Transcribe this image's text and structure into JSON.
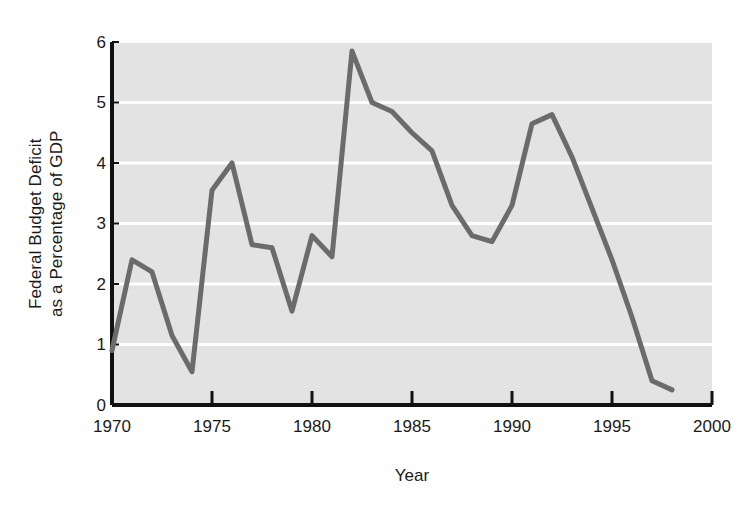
{
  "chart_data": {
    "type": "line",
    "title": "",
    "xlabel": "Year",
    "ylabel_line1": "Federal Budget Deficit",
    "ylabel_line2": "as a Percentage of GDP",
    "xlim": [
      1970,
      2000
    ],
    "ylim": [
      0,
      6
    ],
    "grid": "horizontal-white",
    "legend": "none",
    "xticks": [
      1970,
      1975,
      1980,
      1985,
      1990,
      1995,
      2000
    ],
    "xtick_labels": [
      "1970",
      "1975",
      "1980",
      "1985",
      "1990",
      "1995",
      "2000"
    ],
    "yticks": [
      0,
      1,
      2,
      3,
      4,
      5,
      6
    ],
    "ytick_labels": [
      "0",
      "1",
      "2",
      "3",
      "4",
      "5",
      "6"
    ],
    "series": [
      {
        "name": "Federal Budget Deficit as a Percentage of GDP",
        "color": "#6b6b6b",
        "x": [
          1970,
          1971,
          1972,
          1973,
          1974,
          1975,
          1976,
          1977,
          1978,
          1979,
          1980,
          1981,
          1982,
          1983,
          1984,
          1985,
          1986,
          1987,
          1988,
          1989,
          1990,
          1991,
          1992,
          1993,
          1994,
          1995,
          1996,
          1997,
          1998
        ],
        "values": [
          0.9,
          2.4,
          2.2,
          1.15,
          0.55,
          3.55,
          4.0,
          2.65,
          2.6,
          1.55,
          2.8,
          2.45,
          5.85,
          5.0,
          4.85,
          4.5,
          4.2,
          3.3,
          2.8,
          2.7,
          3.3,
          4.65,
          4.8,
          4.1,
          3.25,
          2.4,
          1.45,
          0.4,
          0.25
        ]
      }
    ],
    "plot_bg_color": "#e3e3e3",
    "gridline_color": "#ffffff",
    "axis_color": "#111111"
  },
  "figure": {
    "background": "#ffffff"
  }
}
